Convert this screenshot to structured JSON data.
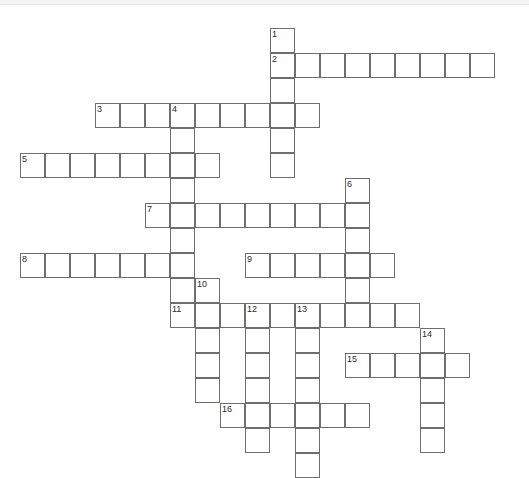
{
  "page": {
    "background_color": "#ffffff",
    "cell_border_color": "#6e6e6e",
    "cell_fill_color": "#ffffff",
    "number_color": "#2b2b2b",
    "width": 529,
    "height": 471
  },
  "grid": {
    "cell_size": 25,
    "origin_x": 20,
    "origin_y": 28,
    "columns": 20,
    "rows": 18
  },
  "entries": [
    {
      "number": "1",
      "direction": "down",
      "col": 10,
      "row": 0,
      "length": 6
    },
    {
      "number": "2",
      "direction": "across",
      "col": 10,
      "row": 1,
      "length": 9
    },
    {
      "number": "3",
      "direction": "across",
      "col": 3,
      "row": 3,
      "length": 9
    },
    {
      "number": "4",
      "direction": "down",
      "col": 6,
      "row": 3,
      "length": 9
    },
    {
      "number": "5",
      "direction": "across",
      "col": 0,
      "row": 5,
      "length": 8
    },
    {
      "number": "6",
      "direction": "down",
      "col": 13,
      "row": 6,
      "length": 6
    },
    {
      "number": "7",
      "direction": "across",
      "col": 5,
      "row": 7,
      "length": 9
    },
    {
      "number": "8",
      "direction": "across",
      "col": 0,
      "row": 9,
      "length": 7
    },
    {
      "number": "9",
      "direction": "across",
      "col": 9,
      "row": 9,
      "length": 6
    },
    {
      "number": "10",
      "direction": "down",
      "col": 7,
      "row": 10,
      "length": 5
    },
    {
      "number": "11",
      "direction": "across",
      "col": 6,
      "row": 11,
      "length": 10
    },
    {
      "number": "12",
      "direction": "down",
      "col": 9,
      "row": 11,
      "length": 6
    },
    {
      "number": "13",
      "direction": "down",
      "col": 11,
      "row": 11,
      "length": 7
    },
    {
      "number": "14",
      "direction": "down",
      "col": 16,
      "row": 12,
      "length": 5
    },
    {
      "number": "15",
      "direction": "across",
      "col": 13,
      "row": 13,
      "length": 5
    },
    {
      "number": "16",
      "direction": "across",
      "col": 8,
      "row": 15,
      "length": 6
    }
  ],
  "numbers": [
    {
      "label": "1",
      "col": 10,
      "row": 0
    },
    {
      "label": "2",
      "col": 10,
      "row": 1
    },
    {
      "label": "3",
      "col": 3,
      "row": 3
    },
    {
      "label": "4",
      "col": 6,
      "row": 3
    },
    {
      "label": "5",
      "col": 0,
      "row": 5
    },
    {
      "label": "6",
      "col": 13,
      "row": 6
    },
    {
      "label": "7",
      "col": 5,
      "row": 7
    },
    {
      "label": "8",
      "col": 0,
      "row": 9
    },
    {
      "label": "9",
      "col": 9,
      "row": 9
    },
    {
      "label": "10",
      "col": 7,
      "row": 10
    },
    {
      "label": "11",
      "col": 6,
      "row": 11
    },
    {
      "label": "12",
      "col": 9,
      "row": 11
    },
    {
      "label": "13",
      "col": 11,
      "row": 11
    },
    {
      "label": "14",
      "col": 16,
      "row": 12
    },
    {
      "label": "15",
      "col": 13,
      "row": 13
    },
    {
      "label": "16",
      "col": 8,
      "row": 15
    }
  ]
}
